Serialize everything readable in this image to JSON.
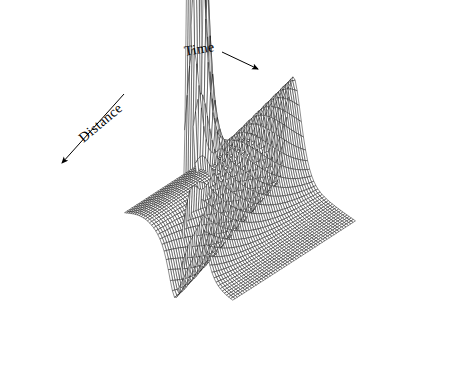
{
  "figure": {
    "kind": "3d-wireframe-surface-plot",
    "background_color": "#ffffff",
    "line_color": "#1a1a1a",
    "width": 470,
    "height": 384
  },
  "labels": {
    "time": "Time",
    "distance": "Distance"
  },
  "annotations": [
    {
      "name": "time-arrow",
      "from_x": 222,
      "from_y": 52,
      "to_x": 258,
      "to_y": 69
    },
    {
      "name": "distance-arrow",
      "from_x": 124,
      "from_y": 94,
      "to_x": 62,
      "to_y": 163
    }
  ],
  "chart_data": {
    "type": "surface",
    "title": "",
    "xlabel": "Time",
    "ylabel": "Distance",
    "zlabel": "",
    "grid": false,
    "legend": "none",
    "axis_box": false,
    "projection": {
      "type": "oblique-isometric",
      "origin_x": 240,
      "origin_y": 224,
      "u_vec_x": 2.08,
      "u_vec_y": 1.42,
      "v_vec_x": -2.36,
      "v_vec_y": 1.53,
      "z_scale": 340
    },
    "nu": 52,
    "nv": 52,
    "xlim": [
      -1,
      1
    ],
    "ylim": [
      -1,
      1
    ],
    "zlim": [
      0,
      1
    ],
    "surface_model": {
      "name": "soliton-sum",
      "terms": [
        {
          "kind": "ridge-sech2",
          "amplitude": 0.3,
          "center_u": 0.06,
          "width_u": 0.2,
          "tilt_v": 0.22
        },
        {
          "kind": "trough-sech2",
          "amplitude": -0.175,
          "center_u": -0.22,
          "width_u": 0.17,
          "tilt_v": 0.18
        },
        {
          "kind": "spike-sech2",
          "amplitude": 1.55,
          "center_u": 0.18,
          "center_v": 0.88,
          "width_u": 0.055,
          "width_v": 0.17
        },
        {
          "kind": "plateau-offset",
          "amplitude": 0.065,
          "center_u": -0.62,
          "width_u": 0.55
        }
      ]
    }
  }
}
